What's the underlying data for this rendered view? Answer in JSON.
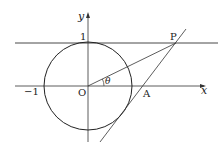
{
  "diagram": {
    "type": "geometry",
    "labels": {
      "y_axis": "y",
      "x_axis": "x",
      "origin": "O",
      "one": "1",
      "minus_one": "−1",
      "point_p": "P",
      "point_a": "A",
      "angle": "θ"
    },
    "colors": {
      "line": "#333333",
      "background": "#ffffff"
    }
  }
}
